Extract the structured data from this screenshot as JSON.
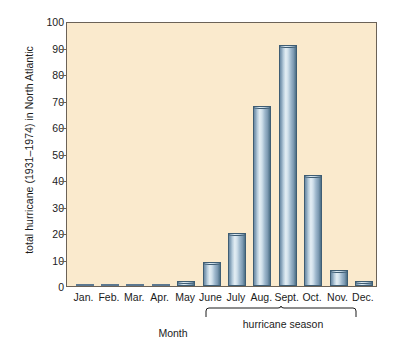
{
  "chart_data": {
    "type": "bar",
    "title": "",
    "xlabel": "Month",
    "ylabel": "total hurricane (1931–1974) in North Atlantic",
    "categories": [
      "Jan.",
      "Feb.",
      "Mar.",
      "Apr.",
      "May",
      "June",
      "July",
      "Aug.",
      "Sept.",
      "Oct.",
      "Nov.",
      "Dec."
    ],
    "values": [
      0,
      0,
      0,
      0,
      2,
      9,
      20,
      68,
      91,
      42,
      6,
      2
    ],
    "ylim": [
      0,
      100
    ],
    "yticks": [
      0,
      10,
      20,
      30,
      40,
      50,
      60,
      70,
      80,
      90,
      100
    ],
    "grid": false,
    "legend": null,
    "annotations": [
      {
        "name": "hurricane-season-bracket",
        "label": "hurricane season",
        "spans": [
          "June",
          "Dec."
        ]
      }
    ],
    "colors": {
      "plot_background": "#faeacd",
      "bar_fill_light": "#e4eef4",
      "bar_fill_dark": "#4d6e86",
      "bar_outline": "#3f5d73",
      "axis": "#6b6257",
      "text": "#1b1b1b"
    }
  }
}
